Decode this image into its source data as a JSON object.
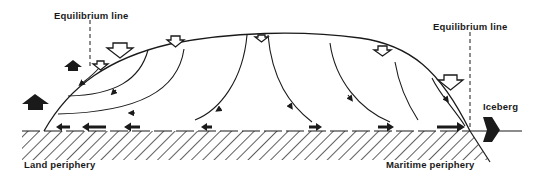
{
  "diagram": {
    "labels": {
      "equilibrium_left": "Equilibrium line",
      "equilibrium_right": "Equilibrium line",
      "iceberg": "Iceberg",
      "land_periphery": "Land periphery",
      "maritime_periphery": "Maritime periphery"
    },
    "colors": {
      "ink": "#1a1a1a",
      "background": "#ffffff"
    }
  }
}
